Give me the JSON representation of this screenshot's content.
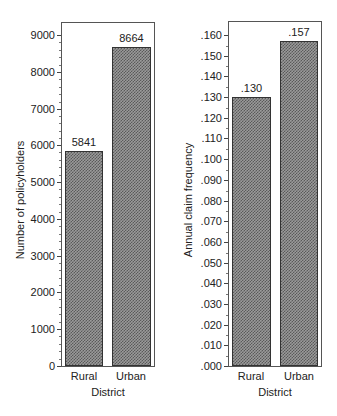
{
  "chart_data": [
    {
      "type": "bar",
      "title": "",
      "categories": [
        "Rural",
        "Urban"
      ],
      "values": [
        5841,
        8664
      ],
      "value_labels": [
        "5841",
        "8664"
      ],
      "xlabel": "District",
      "ylabel": "Number of policyholders",
      "ylim": [
        0,
        9400
      ],
      "yticks": [
        0,
        1000,
        2000,
        3000,
        4000,
        5000,
        6000,
        7000,
        8000,
        9000
      ],
      "ytick_labels": [
        "0",
        "1000",
        "2000",
        "3000",
        "4000",
        "5000",
        "6000",
        "7000",
        "8000",
        "9000"
      ],
      "grid": false,
      "legend": null
    },
    {
      "type": "bar",
      "title": "",
      "categories": [
        "Rural",
        "Urban"
      ],
      "values": [
        0.13,
        0.157
      ],
      "value_labels": [
        ".130",
        ".157"
      ],
      "xlabel": "District",
      "ylabel": "Annual claim frequency",
      "ylim": [
        0,
        0.167
      ],
      "yticks": [
        0,
        0.01,
        0.02,
        0.03,
        0.04,
        0.05,
        0.06,
        0.07,
        0.08,
        0.09,
        0.1,
        0.11,
        0.12,
        0.13,
        0.14,
        0.15,
        0.16
      ],
      "ytick_labels": [
        ".000",
        ".010",
        ".020",
        ".030",
        ".040",
        ".050",
        ".060",
        ".070",
        ".080",
        ".090",
        ".100",
        ".110",
        ".120",
        ".130",
        ".140",
        ".150",
        ".160"
      ],
      "grid": false,
      "legend": null
    }
  ],
  "colors": {
    "bar_fill": "#8a8a8a",
    "bar_pattern": "#5a5a5a",
    "frame": "#555555"
  }
}
